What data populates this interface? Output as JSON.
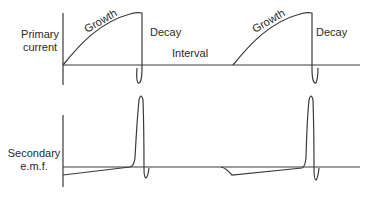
{
  "diagram": {
    "primary": {
      "label_line1": "Primary",
      "label_line2": "current",
      "growth_label": "Growth",
      "decay_label": "Decay",
      "interval_label": "Interval",
      "growth_label_2": "Growth",
      "decay_label_2": "Decay"
    },
    "secondary": {
      "label_line1": "Secondary",
      "label_line2": "e.m.f."
    },
    "colors": {
      "line": "#3a3a3a",
      "text": "#2a2a2a",
      "background": "#ffffff"
    }
  }
}
